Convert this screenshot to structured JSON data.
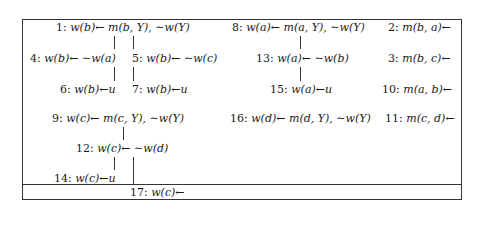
{
  "nodes": [
    {
      "id": "1",
      "text": "w(b)← m(b, Y), ∼w(Y)"
    },
    {
      "id": "4",
      "text": "w(b)← ∼w(a)"
    },
    {
      "id": "5",
      "text": "w(b)← ∼w(c)"
    },
    {
      "id": "6",
      "text": "w(b)←u"
    },
    {
      "id": "7",
      "text": "w(b)←u"
    },
    {
      "id": "8",
      "text": "w(a)← m(a, Y), ∼w(Y)"
    },
    {
      "id": "13",
      "text": "w(a)← ∼w(b)"
    },
    {
      "id": "15",
      "text": "w(a)←u"
    },
    {
      "id": "2",
      "text": "m(b, a)←"
    },
    {
      "id": "3",
      "text": "m(b, c)←"
    },
    {
      "id": "10",
      "text": "m(a, b)←"
    },
    {
      "id": "9",
      "text": "w(c)← m(c, Y), ∼w(Y)"
    },
    {
      "id": "12",
      "text": "w(c)← ∼w(d)"
    },
    {
      "id": "14",
      "text": "w(c)←u"
    },
    {
      "id": "16",
      "text": "w(d)← m(d, Y), ∼w(Y)"
    },
    {
      "id": "11",
      "text": "m(c, d)←"
    },
    {
      "id": "17",
      "text": "w(c)←"
    }
  ]
}
